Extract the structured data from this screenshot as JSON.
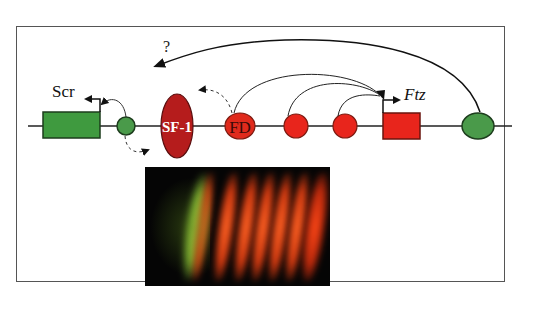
{
  "diagram": {
    "question_mark": "?",
    "genes": [
      {
        "name": "Scr",
        "color": "#3f9a3f",
        "italic": false
      },
      {
        "name": "Ftz",
        "color": "#e8251c",
        "italic": true
      }
    ],
    "factors": [
      {
        "label": "SF-1",
        "color": "#b51c1c",
        "shape": "ellipse"
      },
      {
        "label": "FD",
        "color": "#e02a1c",
        "shape": "ellipse"
      }
    ],
    "colors": {
      "green": "#4a9a4a",
      "red": "#e8251c",
      "dark_red": "#b51c1c",
      "line": "#222222",
      "frame": "#555555"
    }
  },
  "micrograph": {
    "stripe_count": 7,
    "background": "#050505",
    "stripe_colors": [
      "#9fd040",
      "#ff5a1e",
      "#ff5a1e",
      "#ff5a1e",
      "#ff5a1e",
      "#ff5a1e",
      "#ff3a14"
    ]
  }
}
